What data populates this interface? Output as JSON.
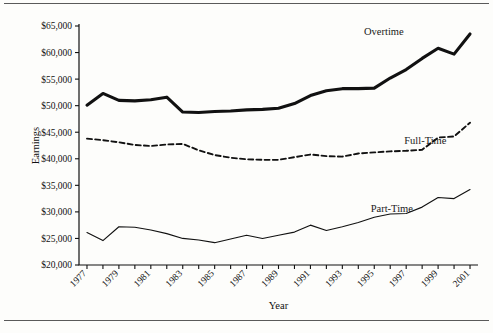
{
  "figure": {
    "y_axis_title": "Earnings",
    "x_axis_title": "Year"
  },
  "chart_data": {
    "type": "line",
    "title": "",
    "xlabel": "Year",
    "ylabel": "Earnings",
    "xlim": [
      1976.5,
      2001.5
    ],
    "ylim": [
      20000,
      65000
    ],
    "ytick_step": 5000,
    "grid": false,
    "legend": "inline-annotations",
    "x": [
      1977,
      1978,
      1979,
      1980,
      1981,
      1982,
      1983,
      1984,
      1985,
      1986,
      1987,
      1988,
      1989,
      1990,
      1991,
      1992,
      1993,
      1994,
      1995,
      1996,
      1997,
      1998,
      1999,
      2000,
      2001
    ],
    "xtick_labels": [
      "1977",
      "1979",
      "1981",
      "1983",
      "1985",
      "1987",
      "1989",
      "1991",
      "1993",
      "1995",
      "1997",
      "1999",
      "2001"
    ],
    "ytick_labels": [
      "$20,000",
      "$25,000",
      "$30,000",
      "$35,000",
      "$40,000",
      "$45,000",
      "$50,000",
      "$55,000",
      "$60,000",
      "$65,000"
    ],
    "series": [
      {
        "name": "Overtime",
        "style": "solid-thick",
        "label_x": 1995.6,
        "label_y": 63300,
        "values": [
          50100,
          52300,
          51000,
          50900,
          51100,
          51600,
          48800,
          48700,
          48900,
          49000,
          49200,
          49300,
          49500,
          50400,
          51900,
          52800,
          53200,
          53200,
          53300,
          55200,
          56800,
          58900,
          60800,
          59700,
          63500
        ]
      },
      {
        "name": "Full-Time",
        "style": "dashed",
        "label_x": 1998.2,
        "label_y": 42700,
        "values": [
          43800,
          43500,
          43100,
          42600,
          42400,
          42700,
          42800,
          41600,
          40700,
          40200,
          39900,
          39800,
          39800,
          40300,
          40800,
          40500,
          40400,
          41000,
          41200,
          41400,
          41500,
          41700,
          44000,
          44200,
          46800
        ]
      },
      {
        "name": "Part-Time",
        "style": "solid-thin",
        "label_x": 1996.1,
        "label_y": 30000,
        "values": [
          26100,
          24600,
          27200,
          27100,
          26600,
          25900,
          25000,
          24700,
          24200,
          24900,
          25600,
          25000,
          25600,
          26200,
          27500,
          26500,
          27200,
          28000,
          29000,
          29600,
          29700,
          30900,
          32700,
          32500,
          34200
        ]
      }
    ]
  }
}
